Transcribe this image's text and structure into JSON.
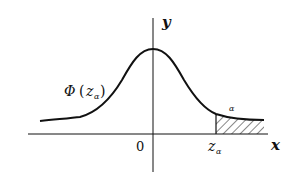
{
  "diagram": {
    "type": "normal-distribution-curve",
    "axes": {
      "x_label": "x",
      "y_label": "y",
      "origin_label": "0"
    },
    "labels": {
      "cdf_symbol": "Φ",
      "cdf_open": "(",
      "cdf_arg": "z",
      "cdf_sub": "α",
      "cdf_close": ")",
      "critical_value": "z",
      "critical_sub": "α",
      "tail_area": "α"
    },
    "colors": {
      "stroke": "#111111",
      "background": "#ffffff"
    }
  }
}
